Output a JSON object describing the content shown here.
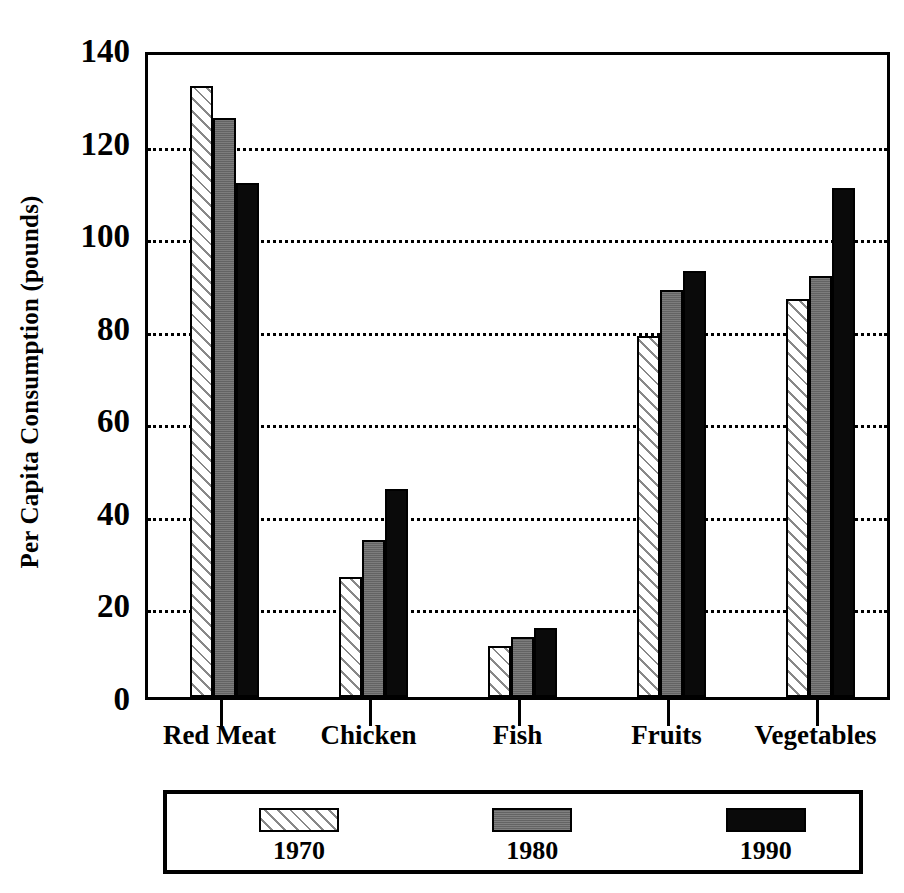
{
  "chart_data": {
    "type": "bar",
    "title": "",
    "xlabel": "",
    "ylabel": "Per Capita Consumption (pounds)",
    "ylim": [
      0,
      140
    ],
    "ytick_labels": [
      "0",
      "20",
      "40",
      "60",
      "80",
      "100",
      "120",
      "140"
    ],
    "ytick_values": [
      0,
      20,
      40,
      60,
      80,
      100,
      120,
      140
    ],
    "gridlines": [
      20,
      40,
      60,
      80,
      100,
      120
    ],
    "grid": true,
    "legend_position": "bottom",
    "categories": [
      "Red Meat",
      "Chicken",
      "Fish",
      "Fruits",
      "Vegetables"
    ],
    "series": [
      {
        "name": "1970",
        "fill": "diagonal-hatch",
        "color": "#ffffff",
        "values": [
          132,
          26,
          11,
          78,
          86
        ]
      },
      {
        "name": "1980",
        "fill": "solid-gray",
        "color": "#6e6e6e",
        "values": [
          125,
          34,
          13,
          88,
          91
        ]
      },
      {
        "name": "1990",
        "fill": "solid-black",
        "color": "#0a0a0a",
        "values": [
          111,
          45,
          15,
          92,
          110
        ]
      }
    ]
  },
  "legend": {
    "entries": [
      {
        "label": "1970"
      },
      {
        "label": "1980"
      },
      {
        "label": "1990"
      }
    ]
  }
}
